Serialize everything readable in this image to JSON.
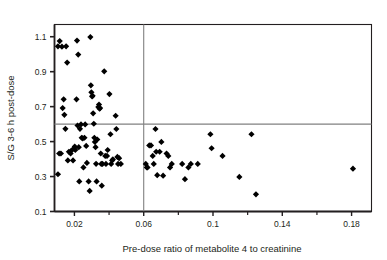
{
  "chart_data": {
    "type": "scatter",
    "title": "",
    "xlabel": "Pre-dose ratio of metabolite 4 to creatinine",
    "ylabel": "S/G 3-6 h post-dose",
    "xlim": [
      0.0085,
      0.1915
    ],
    "ylim": [
      0.1,
      1.17
    ],
    "grid": false,
    "legend": null,
    "xticks_major": [
      0.02,
      0.06,
      0.1,
      0.14,
      0.18
    ],
    "xticks_major_labels": [
      "0.02",
      "0.06",
      "0.1",
      "0.14",
      "0.18"
    ],
    "xticks_minor": [
      0.04,
      0.08,
      0.12,
      0.16
    ],
    "yticks_major": [
      0.1,
      0.3,
      0.5,
      0.7,
      0.9,
      1.1
    ],
    "yticks_major_labels": [
      "0.1",
      "0.3",
      "0.5",
      "0.7",
      "0.9",
      "1.1"
    ],
    "marker": "diamond",
    "marker_color": "#000000",
    "marker_size": 5,
    "reference_lines": [
      {
        "orientation": "vertical",
        "value": 0.06,
        "color": "#808080"
      },
      {
        "orientation": "horizontal",
        "value": 0.6,
        "color": "#808080"
      }
    ],
    "points": [
      [
        0.0105,
        0.313
      ],
      [
        0.0105,
        1.045
      ],
      [
        0.0115,
        1.075
      ],
      [
        0.0112,
        0.432
      ],
      [
        0.0122,
        0.432
      ],
      [
        0.0128,
        1.043
      ],
      [
        0.0132,
        0.692
      ],
      [
        0.0138,
        0.742
      ],
      [
        0.0142,
        0.653
      ],
      [
        0.0148,
        0.573
      ],
      [
        0.0152,
        1.045
      ],
      [
        0.0158,
        0.952
      ],
      [
        0.0162,
        0.392
      ],
      [
        0.0168,
        0.442
      ],
      [
        0.0178,
        0.432
      ],
      [
        0.0182,
        0.448
      ],
      [
        0.0192,
        0.392
      ],
      [
        0.0198,
        0.462
      ],
      [
        0.0202,
        0.472
      ],
      [
        0.0205,
        0.452
      ],
      [
        0.0212,
        0.742
      ],
      [
        0.0215,
        1.078
      ],
      [
        0.0218,
        0.592
      ],
      [
        0.0222,
        0.998
      ],
      [
        0.0225,
        0.468
      ],
      [
        0.0228,
        0.272
      ],
      [
        0.0232,
        0.573
      ],
      [
        0.0238,
        0.598
      ],
      [
        0.0242,
        0.522
      ],
      [
        0.0248,
        0.518
      ],
      [
        0.0252,
        0.352
      ],
      [
        0.0258,
        0.522
      ],
      [
        0.0262,
        0.598
      ],
      [
        0.0268,
        0.475
      ],
      [
        0.0272,
        0.378
      ],
      [
        0.0282,
        0.272
      ],
      [
        0.0288,
        0.218
      ],
      [
        0.0292,
        1.098
      ],
      [
        0.0295,
        0.822
      ],
      [
        0.0298,
        0.782
      ],
      [
        0.0302,
        0.758
      ],
      [
        0.0305,
        0.762
      ],
      [
        0.0308,
        0.662
      ],
      [
        0.0312,
        0.602
      ],
      [
        0.0315,
        0.522
      ],
      [
        0.0318,
        0.498
      ],
      [
        0.0322,
        0.468
      ],
      [
        0.0325,
        0.373
      ],
      [
        0.0328,
        0.272
      ],
      [
        0.0332,
        0.512
      ],
      [
        0.0338,
        0.698
      ],
      [
        0.0342,
        0.712
      ],
      [
        0.0345,
        0.688
      ],
      [
        0.0348,
        0.692
      ],
      [
        0.0352,
        0.432
      ],
      [
        0.0355,
        0.372
      ],
      [
        0.0358,
        0.248
      ],
      [
        0.0362,
        0.372
      ],
      [
        0.0372,
        0.902
      ],
      [
        0.0378,
        0.418
      ],
      [
        0.0382,
        0.372
      ],
      [
        0.0388,
        0.418
      ],
      [
        0.0392,
        0.452
      ],
      [
        0.0402,
        0.772
      ],
      [
        0.0408,
        0.542
      ],
      [
        0.0412,
        0.372
      ],
      [
        0.0418,
        0.392
      ],
      [
        0.0422,
        0.398
      ],
      [
        0.0438,
        0.648
      ],
      [
        0.0442,
        0.572
      ],
      [
        0.0448,
        0.412
      ],
      [
        0.0452,
        0.372
      ],
      [
        0.0458,
        0.405
      ],
      [
        0.0468,
        0.372
      ],
      [
        0.0612,
        0.372
      ],
      [
        0.0618,
        0.352
      ],
      [
        0.0622,
        0.352
      ],
      [
        0.0632,
        0.478
      ],
      [
        0.0642,
        0.478
      ],
      [
        0.0652,
        0.418
      ],
      [
        0.0658,
        0.372
      ],
      [
        0.0668,
        0.572
      ],
      [
        0.0672,
        0.442
      ],
      [
        0.0678,
        0.308
      ],
      [
        0.0692,
        0.442
      ],
      [
        0.0702,
        0.498
      ],
      [
        0.0712,
        0.305
      ],
      [
        0.0732,
        0.432
      ],
      [
        0.0742,
        0.418
      ],
      [
        0.0752,
        0.352
      ],
      [
        0.0762,
        0.372
      ],
      [
        0.0822,
        0.372
      ],
      [
        0.0838,
        0.285
      ],
      [
        0.0858,
        0.352
      ],
      [
        0.0872,
        0.372
      ],
      [
        0.0912,
        0.372
      ],
      [
        0.0985,
        0.542
      ],
      [
        0.0992,
        0.462
      ],
      [
        0.1055,
        0.418
      ],
      [
        0.1152,
        0.298
      ],
      [
        0.1222,
        0.542
      ],
      [
        0.1248,
        0.198
      ],
      [
        0.1808,
        0.345
      ]
    ]
  },
  "axis": {
    "x_label": "Pre-dose ratio of metabolite 4 to creatinine",
    "y_label": "S/G 3-6 h post-dose"
  }
}
